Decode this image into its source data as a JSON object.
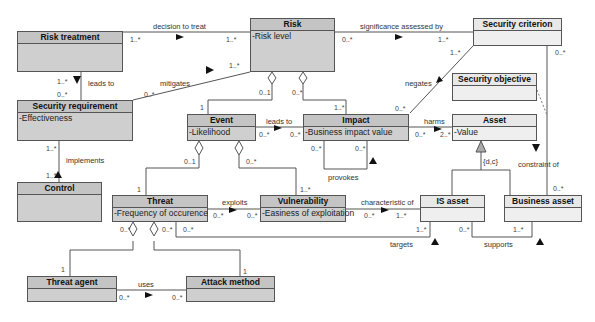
{
  "diagram": {
    "type": "UML class diagram",
    "colors": {
      "concept_fill": "#cfcfcf",
      "asset_fill": "#efefef",
      "line": "#555555"
    },
    "classes": {
      "risk_treatment": {
        "name": "Risk treatment",
        "attributes": []
      },
      "risk": {
        "name": "Risk",
        "attributes": [
          "-Risk level"
        ]
      },
      "security_criterion": {
        "name": "Security criterion",
        "attributes": []
      },
      "security_requirement": {
        "name": "Security requirement",
        "attributes": [
          "-Effectiveness"
        ]
      },
      "security_objective": {
        "name": "Security objective",
        "attributes": []
      },
      "event": {
        "name": "Event",
        "attributes": [
          "-Likelihood"
        ]
      },
      "impact": {
        "name": "Impact",
        "attributes": [
          "-Business impact value"
        ]
      },
      "asset": {
        "name": "Asset",
        "attributes": [
          "-Value"
        ]
      },
      "control": {
        "name": "Control",
        "attributes": []
      },
      "threat": {
        "name": "Threat",
        "attributes": [
          "-Frequency of occurence"
        ]
      },
      "vulnerability": {
        "name": "Vulnerability",
        "attributes": [
          "-Easiness of exploitation"
        ]
      },
      "is_asset": {
        "name": "IS asset",
        "attributes": []
      },
      "business_asset": {
        "name": "Business asset",
        "attributes": []
      },
      "threat_agent": {
        "name": "Threat agent",
        "attributes": []
      },
      "attack_method": {
        "name": "Attack method",
        "attributes": []
      }
    },
    "associations": {
      "decision_to_treat": {
        "label": "decision to treat",
        "from_mult": "1..*",
        "to_mult": "1..*"
      },
      "significance_assessed_by": {
        "label": "significance assessed by",
        "from_mult": "0..*",
        "to_mult": "1..*"
      },
      "leads_to_req": {
        "label": "leads to",
        "from_mult": "1..*",
        "to_mult": "0..*"
      },
      "mitigates": {
        "label": "mitigates",
        "from_mult": "0..*",
        "to_mult": "1..*"
      },
      "negates": {
        "label": "negates",
        "from_mult": "0..*",
        "to_mult": "1..*"
      },
      "risk_event": {
        "risk_mult": "0..1",
        "event_mult": "1"
      },
      "risk_impact": {
        "risk_mult": "0..*",
        "impact_mult": "1..*"
      },
      "constraint_of": {
        "label": "constraint of",
        "from_mult": "0..*",
        "to_mult": "0..*"
      },
      "implements": {
        "label": "implements",
        "from_mult": "1..*",
        "to_mult": "1..*"
      },
      "leads_to_impact": {
        "label": "leads to",
        "from_mult": "0..*",
        "to_mult": "0..*"
      },
      "harms": {
        "label": "harms",
        "from_mult": "0..*",
        "to_mult": "2..*"
      },
      "provokes": {
        "label": "provokes",
        "from_mult": "0..*",
        "to_mult": "0..*"
      },
      "generalization": {
        "label": "{d,c}"
      },
      "event_threat": {
        "event_mult": "0..1",
        "threat_mult": "1"
      },
      "event_vuln": {
        "event_mult": "0..*",
        "vuln_mult": "1..*"
      },
      "exploits": {
        "label": "exploits",
        "from_mult": "0..*",
        "to_mult": "0..*"
      },
      "characteristic_of": {
        "label": "characteristic of",
        "from_mult": "0..*",
        "to_mult": "1..*"
      },
      "targets": {
        "label": "targets",
        "from_mult": "0..*",
        "to_mult": "1..*"
      },
      "supports": {
        "label": "supports",
        "from_mult": "0..*",
        "to_mult": "1..*"
      },
      "threat_agent_agg": {
        "threat_mult": "0..*",
        "agent_mult": "1"
      },
      "threat_method_agg": {
        "threat_mult": "0..*",
        "method_mult": "1"
      },
      "uses": {
        "label": "uses",
        "from_mult": "0..*",
        "to_mult": "0..*"
      }
    }
  }
}
